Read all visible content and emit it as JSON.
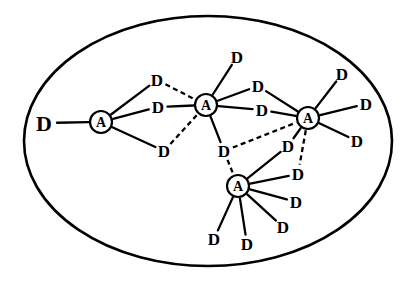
{
  "figure": {
    "type": "node-link-diagram",
    "background_color": "#ffffff",
    "line_color": "#000000"
  },
  "boundary": {
    "shape": "ellipse",
    "cx": 208,
    "cy": 141,
    "rx": 184,
    "ry": 125,
    "stroke_width": 2.6
  },
  "node_labels": {
    "agent": "A",
    "device": "D"
  },
  "agents": [
    {
      "id": "A1",
      "label": "A",
      "x": 101,
      "y": 122,
      "r": 11
    },
    {
      "id": "A2",
      "label": "A",
      "x": 206,
      "y": 105,
      "r": 11
    },
    {
      "id": "A3",
      "label": "A",
      "x": 308,
      "y": 118,
      "r": 11
    },
    {
      "id": "A4",
      "label": "A",
      "x": 238,
      "y": 186,
      "r": 11
    }
  ],
  "devices": [
    {
      "id": "D1",
      "label": "D",
      "x": 44,
      "y": 123,
      "size": "big"
    },
    {
      "id": "D2",
      "label": "D",
      "x": 157,
      "y": 80,
      "size": "normal"
    },
    {
      "id": "D3",
      "label": "D",
      "x": 158,
      "y": 107,
      "size": "normal"
    },
    {
      "id": "D4",
      "label": "D",
      "x": 164,
      "y": 151,
      "size": "normal"
    },
    {
      "id": "D5",
      "label": "D",
      "x": 237,
      "y": 57,
      "size": "normal"
    },
    {
      "id": "D6",
      "label": "D",
      "x": 258,
      "y": 86,
      "size": "normal"
    },
    {
      "id": "D7",
      "label": "D",
      "x": 262,
      "y": 110,
      "size": "normal"
    },
    {
      "id": "D8",
      "label": "D",
      "x": 224,
      "y": 151,
      "size": "normal"
    },
    {
      "id": "D9",
      "label": "D",
      "x": 342,
      "y": 74,
      "size": "normal"
    },
    {
      "id": "D10",
      "label": "D",
      "x": 366,
      "y": 104,
      "size": "normal"
    },
    {
      "id": "D11",
      "label": "D",
      "x": 357,
      "y": 141,
      "size": "normal"
    },
    {
      "id": "D12",
      "label": "D",
      "x": 288,
      "y": 146,
      "size": "normal"
    },
    {
      "id": "D13",
      "label": "D",
      "x": 298,
      "y": 174,
      "size": "normal"
    },
    {
      "id": "D14",
      "label": "D",
      "x": 296,
      "y": 202,
      "size": "normal"
    },
    {
      "id": "D15",
      "label": "D",
      "x": 283,
      "y": 227,
      "size": "normal"
    },
    {
      "id": "D16",
      "label": "D",
      "x": 247,
      "y": 244,
      "size": "normal"
    },
    {
      "id": "D17",
      "label": "D",
      "x": 214,
      "y": 239,
      "size": "normal"
    }
  ],
  "edges": [
    {
      "from": "D1",
      "to": "A1",
      "style": "solid"
    },
    {
      "from": "A1",
      "to": "D2",
      "style": "solid"
    },
    {
      "from": "A1",
      "to": "D3",
      "style": "solid"
    },
    {
      "from": "A1",
      "to": "D4",
      "style": "solid"
    },
    {
      "from": "D2",
      "to": "A2",
      "style": "dashed"
    },
    {
      "from": "D3",
      "to": "A2",
      "style": "solid"
    },
    {
      "from": "D4",
      "to": "A2",
      "style": "dashed"
    },
    {
      "from": "A2",
      "to": "D5",
      "style": "solid"
    },
    {
      "from": "A2",
      "to": "D6",
      "style": "solid"
    },
    {
      "from": "A2",
      "to": "D7",
      "style": "solid"
    },
    {
      "from": "A2",
      "to": "D8",
      "style": "solid"
    },
    {
      "from": "D6",
      "to": "A3",
      "style": "solid"
    },
    {
      "from": "D7",
      "to": "A3",
      "style": "solid"
    },
    {
      "from": "D8",
      "to": "A3",
      "style": "dashed"
    },
    {
      "from": "A3",
      "to": "D9",
      "style": "solid"
    },
    {
      "from": "A3",
      "to": "D10",
      "style": "solid"
    },
    {
      "from": "A3",
      "to": "D11",
      "style": "solid"
    },
    {
      "from": "A3",
      "to": "D12",
      "style": "solid"
    },
    {
      "from": "A3",
      "to": "D13",
      "style": "dashed"
    },
    {
      "from": "D8",
      "to": "A4",
      "style": "dashed"
    },
    {
      "from": "A4",
      "to": "D12",
      "style": "solid"
    },
    {
      "from": "A4",
      "to": "D13",
      "style": "solid"
    },
    {
      "from": "A4",
      "to": "D14",
      "style": "solid"
    },
    {
      "from": "A4",
      "to": "D15",
      "style": "solid"
    },
    {
      "from": "A4",
      "to": "D16",
      "style": "solid"
    },
    {
      "from": "A4",
      "to": "D17",
      "style": "solid"
    }
  ]
}
